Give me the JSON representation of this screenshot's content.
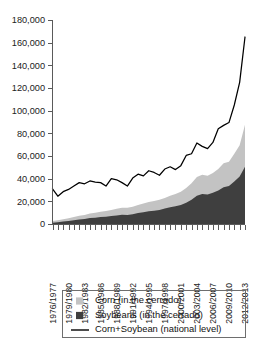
{
  "chart_data": {
    "type": "area",
    "title": "",
    "subtitle": "",
    "xlabel": "",
    "ylabel": "",
    "ylim": [
      0,
      180000
    ],
    "ytick_values": [
      0,
      20000,
      40000,
      60000,
      80000,
      100000,
      120000,
      140000,
      160000,
      180000
    ],
    "ytick_labels": [
      "0",
      "20,000",
      "40,000",
      "60,000",
      "80,000",
      "100,000",
      "120,000",
      "140,000",
      "160,000",
      "180,000"
    ],
    "grid": false,
    "legend_position": "bottom",
    "x": [
      "1976/1977",
      "1977/1978",
      "1978/1979",
      "1979/1980",
      "1980/1981",
      "1981/1982",
      "1982/1983",
      "1983/1984",
      "1984/1985",
      "1985/1986",
      "1986/1987",
      "1987/1988",
      "1988/1989",
      "1989/1990",
      "1990/1991",
      "1991/1992",
      "1992/1993",
      "1993/1994",
      "1994/1995",
      "1995/1996",
      "1996/1997",
      "1997/1998",
      "1998/1999",
      "1999/2000",
      "2000/2001",
      "2001/2002",
      "2002/2003",
      "2003/2004",
      "2004/2005",
      "2005/2006",
      "2006/2007",
      "2007/2008",
      "2008/2009",
      "2009/2010",
      "2010/2011",
      "2011/2012",
      "2012/2013"
    ],
    "xtick_labels_shown": [
      "1976/1977",
      "1979/1980",
      "1982/1983",
      "1985/1986",
      "1988/1989",
      "1991/1992",
      "1994/1995",
      "1997/1998",
      "2000/2001",
      "2003/2004",
      "2006/2007",
      "2009/2010",
      "2012/2013"
    ],
    "series": [
      {
        "name": "Soybeans (in the cerrado)",
        "kind": "stacked-area",
        "color": "#3f3f3f",
        "values": [
          1200,
          1600,
          2100,
          2600,
          3200,
          3900,
          4400,
          5200,
          5600,
          6100,
          6400,
          7000,
          7600,
          8200,
          8000,
          8600,
          9600,
          10400,
          11200,
          11800,
          12400,
          13600,
          14800,
          15600,
          16800,
          18800,
          21500,
          25000,
          26500,
          26000,
          27500,
          29500,
          32500,
          33500,
          37500,
          42000,
          50500
        ]
      },
      {
        "name": "Corn (in the cerrado)",
        "kind": "stacked-area",
        "color": "#c3c3c3",
        "values": [
          1400,
          1700,
          2000,
          2400,
          2900,
          3300,
          3600,
          4100,
          4300,
          4800,
          5000,
          5400,
          5800,
          6200,
          6300,
          6600,
          7200,
          7600,
          8200,
          8600,
          8900,
          9400,
          10200,
          10800,
          11600,
          13000,
          14500,
          16500,
          17000,
          16500,
          17500,
          19000,
          21000,
          21500,
          24500,
          27500,
          37000
        ]
      },
      {
        "name": "Corn+Soybean (national level)",
        "kind": "line",
        "color": "#000000",
        "values": [
          31000,
          24500,
          28500,
          30500,
          33500,
          36500,
          35500,
          38000,
          37000,
          36500,
          33500,
          40000,
          39000,
          36500,
          33500,
          40500,
          44000,
          42500,
          47000,
          45500,
          43000,
          48500,
          50500,
          48000,
          51500,
          60500,
          62000,
          71500,
          68500,
          66500,
          72000,
          84000,
          87000,
          89500,
          105000,
          125000,
          165000
        ]
      }
    ],
    "legend": [
      {
        "label": "Corn (in the cerrado)",
        "marker": "swatch",
        "color": "#c3c3c3"
      },
      {
        "label": "Soybeans (in the cerrado)",
        "marker": "swatch",
        "color": "#3f3f3f"
      },
      {
        "label": "Corn+Soybean (national level)",
        "marker": "line",
        "color": "#000000"
      }
    ]
  },
  "colors": {
    "corn": "#c3c3c3",
    "soybeans": "#3f3f3f",
    "line": "#000000",
    "axis": "#5a5a5a",
    "legend_border": "#6e6e6e",
    "background": "#ffffff"
  }
}
